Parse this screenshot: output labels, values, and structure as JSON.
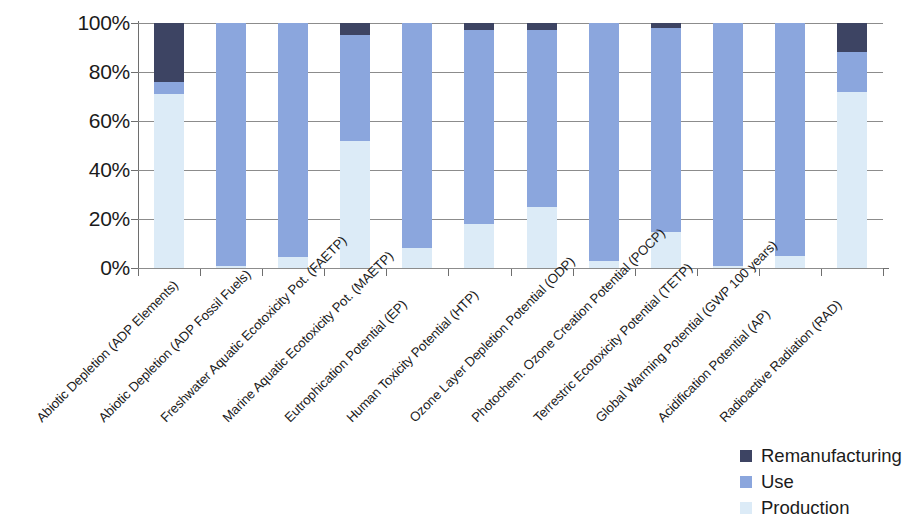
{
  "chart_data": {
    "type": "bar",
    "stacked": true,
    "normalized": true,
    "title": "",
    "subtitle": "",
    "xlabel": "",
    "ylabel": "",
    "ylim": [
      0,
      100
    ],
    "ytick_labels": [
      "0%",
      "20%",
      "40%",
      "60%",
      "80%",
      "100%"
    ],
    "ytick_values": [
      0,
      20,
      40,
      60,
      80,
      100
    ],
    "grid": true,
    "legend_position": "bottom-right",
    "categories": [
      "Abiotic Depletion (ADP Elements)",
      "Abiotic Depletion (ADP Fossil Fuels)",
      "Freshwater Aquatic Ecotoxicity Pot. (FAETP)",
      "Marine Aquatic Ecotoxicity Pot. (MAETP)",
      "Eutrophication Potential (EP)",
      "Human Toxicity Potential (HTP)",
      "Ozone Layer Depletion Potential (ODP)",
      "Photochem. Ozone Creation Potential (POCP)",
      "Terrestric Ecotoxicity Potential (TETP)",
      "Global Warming Potential (GWP 100 years)",
      "Acidification Potential (AP)",
      "Radioactive Radiation (RAD)"
    ],
    "series": [
      {
        "name": "Production",
        "color": "#dcebf7",
        "values": [
          71,
          1,
          4.5,
          52,
          8,
          18,
          25,
          3,
          14.5,
          1,
          5,
          72
        ]
      },
      {
        "name": "Use",
        "color": "#8ba6dd",
        "values": [
          5,
          99,
          95.5,
          43,
          92,
          79,
          72,
          97,
          83.5,
          99,
          95,
          16
        ]
      },
      {
        "name": "Remanufacturing",
        "color": "#3d4463",
        "values": [
          24,
          0,
          0,
          5,
          0,
          3,
          3,
          0,
          2,
          0,
          0,
          12
        ]
      }
    ]
  },
  "legend": {
    "items": [
      {
        "label": "Remanufacturing",
        "color": "#3d4463"
      },
      {
        "label": "Use",
        "color": "#8ba6dd"
      },
      {
        "label": "Production",
        "color": "#dcebf7"
      }
    ]
  },
  "axis": {
    "gridline_color": "#8c8c8c",
    "axis_color": "#6e6e6e"
  }
}
